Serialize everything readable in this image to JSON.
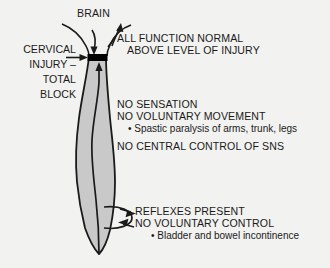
{
  "figure": {
    "background_color": "#f2f2f0",
    "ink_color": "#1a1a1a",
    "cord_fill_color": "#c9c9c9",
    "injury_block_color": "#000000"
  },
  "labels": {
    "brain": "BRAIN",
    "cervical_injury": {
      "line1": "CERVICAL",
      "line2": "INJURY –",
      "line3": "TOTAL",
      "line4": "BLOCK"
    },
    "above_injury": {
      "line1": "ALL FUNCTION NORMAL",
      "line2": "ABOVE LEVEL OF INJURY"
    },
    "below_injury": {
      "line1": "NO SENSATION",
      "line2": "NO VOLUNTARY MOVEMENT",
      "bullet1": "• Spastic paralysis of arms, trunk, legs",
      "line3": "NO CENTRAL CONTROL OF SNS"
    },
    "reflex_arc": {
      "line1": "REFLEXES PRESENT",
      "line2": "NO VOLUNTARY CONTROL",
      "bullet1": "• Bladder and bowel incontinence"
    }
  }
}
